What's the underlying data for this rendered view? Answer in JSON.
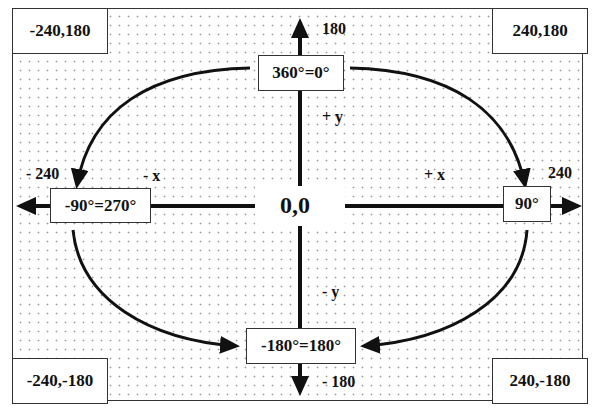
{
  "diagram": {
    "type": "coordinate-axes-with-rotation-angles",
    "corners": {
      "top_left": "-240,180",
      "top_right": "240,180",
      "bottom_left": "-240,-180",
      "bottom_right": "240,-180"
    },
    "origin": "0,0",
    "axis_labels": {
      "y_max": "180",
      "y_min": "- 180",
      "x_max": "240",
      "x_min": "- 240",
      "plus_y": "+ y",
      "minus_y": "- y",
      "plus_x": "+ x",
      "minus_x": "- x"
    },
    "angle_boxes": {
      "top": "360°=0°",
      "right": "90°",
      "bottom": "-180°=180°",
      "left": "-90°=270°"
    },
    "colors": {
      "line": "#111111",
      "box_border": "#333333",
      "dot_pattern": "#9a9a9a",
      "background": "#ffffff"
    }
  }
}
